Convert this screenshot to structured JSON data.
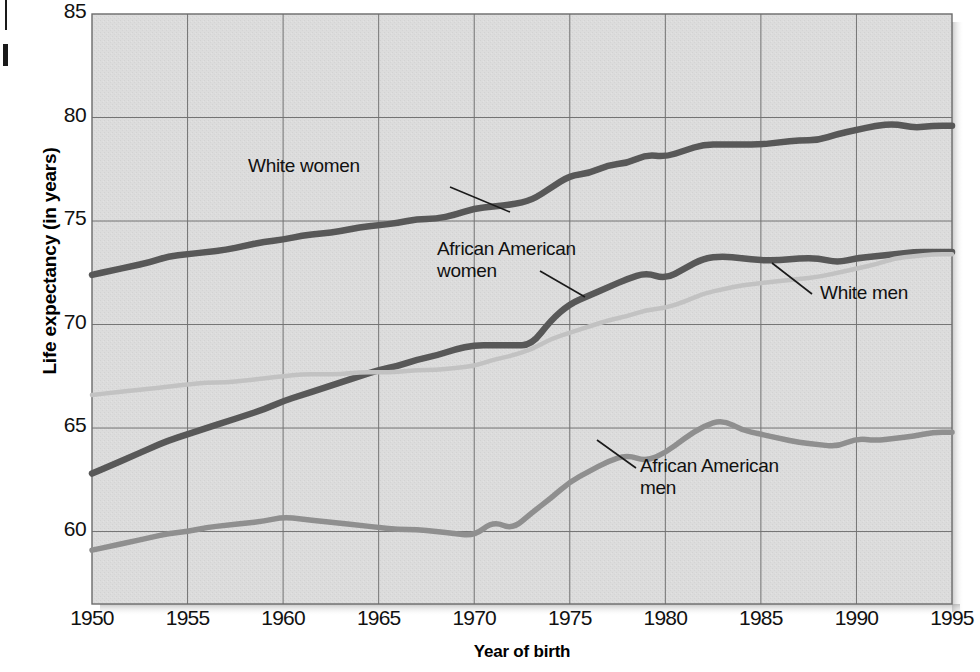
{
  "chart_data": {
    "type": "line",
    "title": "",
    "xlabel": "Year of birth",
    "ylabel": "Life expectancy (in years)",
    "xlim": [
      1950,
      1995
    ],
    "ylim": [
      56.5,
      85
    ],
    "xticks": [
      1950,
      1955,
      1960,
      1965,
      1970,
      1975,
      1980,
      1985,
      1990,
      1995
    ],
    "yticks": [
      60,
      65,
      70,
      75,
      80,
      85
    ],
    "grid": true,
    "legend_position": "inline-annotations",
    "plot_background": "#dcdcdc",
    "series": [
      {
        "name": "White women",
        "color": "#585858",
        "label_text": "White women",
        "x": [
          1950,
          1951,
          1952,
          1953,
          1954,
          1955,
          1956,
          1957,
          1958,
          1959,
          1960,
          1961,
          1962,
          1963,
          1964,
          1965,
          1966,
          1967,
          1968,
          1969,
          1970,
          1971,
          1972,
          1973,
          1974,
          1975,
          1976,
          1977,
          1978,
          1979,
          1980,
          1981,
          1982,
          1983,
          1984,
          1985,
          1986,
          1987,
          1988,
          1989,
          1990,
          1991,
          1992,
          1993,
          1994,
          1995
        ],
        "values": [
          72.4,
          72.6,
          72.8,
          73.0,
          73.3,
          73.4,
          73.5,
          73.6,
          73.8,
          74.0,
          74.1,
          74.3,
          74.4,
          74.5,
          74.7,
          74.8,
          74.9,
          75.1,
          75.1,
          75.3,
          75.6,
          75.7,
          75.8,
          76.0,
          76.6,
          77.2,
          77.3,
          77.7,
          77.8,
          78.2,
          78.1,
          78.4,
          78.7,
          78.7,
          78.7,
          78.7,
          78.8,
          78.9,
          78.9,
          79.2,
          79.4,
          79.6,
          79.7,
          79.5,
          79.6,
          79.6
        ]
      },
      {
        "name": "African American women",
        "color": "#585858",
        "label_text": "African American\nwomen",
        "x": [
          1950,
          1951,
          1952,
          1953,
          1954,
          1955,
          1956,
          1957,
          1958,
          1959,
          1960,
          1961,
          1962,
          1963,
          1964,
          1965,
          1966,
          1967,
          1968,
          1969,
          1970,
          1971,
          1972,
          1973,
          1974,
          1975,
          1976,
          1977,
          1978,
          1979,
          1980,
          1981,
          1982,
          1983,
          1984,
          1985,
          1986,
          1987,
          1988,
          1989,
          1990,
          1991,
          1992,
          1993,
          1994,
          1995
        ],
        "values": [
          62.8,
          63.2,
          63.6,
          64.0,
          64.4,
          64.7,
          65.0,
          65.3,
          65.6,
          65.9,
          66.3,
          66.6,
          66.9,
          67.2,
          67.5,
          67.8,
          68.0,
          68.3,
          68.5,
          68.8,
          69.0,
          69.0,
          69.0,
          69.0,
          70.2,
          71.0,
          71.4,
          71.8,
          72.2,
          72.5,
          72.2,
          72.7,
          73.2,
          73.3,
          73.2,
          73.1,
          73.1,
          73.2,
          73.2,
          73.0,
          73.2,
          73.3,
          73.4,
          73.5,
          73.5,
          73.5
        ]
      },
      {
        "name": "White men",
        "color": "#c2c2c2",
        "label_text": "White men",
        "x": [
          1950,
          1951,
          1952,
          1953,
          1954,
          1955,
          1956,
          1957,
          1958,
          1959,
          1960,
          1961,
          1962,
          1963,
          1964,
          1965,
          1966,
          1967,
          1968,
          1969,
          1970,
          1971,
          1972,
          1973,
          1974,
          1975,
          1976,
          1977,
          1978,
          1979,
          1980,
          1981,
          1982,
          1983,
          1984,
          1985,
          1986,
          1987,
          1988,
          1989,
          1990,
          1991,
          1992,
          1993,
          1994,
          1995
        ],
        "values": [
          66.6,
          66.7,
          66.8,
          66.9,
          67.0,
          67.1,
          67.2,
          67.2,
          67.3,
          67.4,
          67.5,
          67.6,
          67.6,
          67.6,
          67.7,
          67.7,
          67.7,
          67.8,
          67.8,
          67.9,
          68.0,
          68.3,
          68.5,
          68.8,
          69.3,
          69.6,
          69.9,
          70.2,
          70.4,
          70.7,
          70.8,
          71.1,
          71.5,
          71.7,
          71.9,
          72.0,
          72.1,
          72.2,
          72.3,
          72.5,
          72.7,
          72.9,
          73.2,
          73.3,
          73.4,
          73.4
        ]
      },
      {
        "name": "African American men",
        "color": "#8f8f8f",
        "label_text": "African American\nmen",
        "x": [
          1950,
          1951,
          1952,
          1953,
          1954,
          1955,
          1956,
          1957,
          1958,
          1959,
          1960,
          1961,
          1962,
          1963,
          1964,
          1965,
          1966,
          1967,
          1968,
          1969,
          1970,
          1971,
          1972,
          1973,
          1974,
          1975,
          1976,
          1977,
          1978,
          1979,
          1980,
          1981,
          1982,
          1983,
          1984,
          1985,
          1986,
          1987,
          1988,
          1989,
          1990,
          1991,
          1992,
          1993,
          1994,
          1995
        ],
        "values": [
          59.1,
          59.3,
          59.5,
          59.7,
          59.9,
          60.0,
          60.2,
          60.3,
          60.4,
          60.5,
          60.7,
          60.6,
          60.5,
          60.4,
          60.3,
          60.2,
          60.1,
          60.1,
          60.0,
          59.9,
          59.8,
          60.5,
          60.1,
          60.9,
          61.6,
          62.4,
          62.9,
          63.4,
          63.7,
          63.4,
          63.8,
          64.5,
          65.1,
          65.4,
          64.9,
          64.7,
          64.5,
          64.3,
          64.2,
          64.1,
          64.5,
          64.4,
          64.5,
          64.6,
          64.8,
          64.8
        ]
      }
    ]
  },
  "annotations": [
    {
      "id": "white-women",
      "text": "White women"
    },
    {
      "id": "african-american-women",
      "text": "African American\nwomen"
    },
    {
      "id": "white-men",
      "text": "White men"
    },
    {
      "id": "african-american-men",
      "text": "African American\nmen"
    }
  ],
  "axes": {
    "y_title": "Life expectancy (in years)",
    "x_title": "Year of birth",
    "y_tick_labels": [
      "85",
      "80",
      "75",
      "70",
      "65",
      "60"
    ],
    "x_tick_labels": [
      "1950",
      "1955",
      "1960",
      "1965",
      "1970",
      "1975",
      "1980",
      "1985",
      "1990",
      "1995"
    ]
  }
}
